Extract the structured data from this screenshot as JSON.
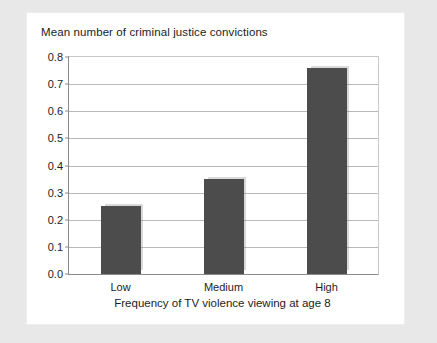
{
  "card": {
    "background_color": "#ffffff",
    "page_background_color": "#e8e8e8"
  },
  "chart_data": {
    "type": "bar",
    "title": "Mean number of criminal justice convictions",
    "xlabel": "Frequency of TV violence viewing at age 8",
    "ylabel": "Mean number of criminal justice convictions",
    "categories": [
      "Low",
      "Medium",
      "High"
    ],
    "values": [
      0.25,
      0.35,
      0.76
    ],
    "ylim": [
      0.0,
      0.8
    ],
    "ytick_labels": [
      "0.0",
      "0.1",
      "0.2",
      "0.3",
      "0.4",
      "0.5",
      "0.6",
      "0.7",
      "0.8"
    ],
    "ytick_values": [
      0.0,
      0.1,
      0.2,
      0.3,
      0.4,
      0.5,
      0.6,
      0.7,
      0.8
    ],
    "grid": true,
    "legend": false,
    "bar_color": "#4c4c4c",
    "gridline_color": "#b9b9b9",
    "axis_color": "#8a8a8a"
  }
}
